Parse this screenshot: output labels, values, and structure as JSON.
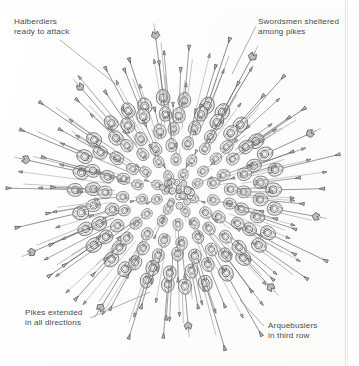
{
  "page": {
    "kind": "scanned-book-illustration",
    "background_color": "#fdfdfc",
    "ink_color": "#5a5a5a",
    "label_color": "#4a4a4a",
    "leader_color": "#8c8c8c",
    "width": 359,
    "height": 366
  },
  "annotations": [
    {
      "id": "halberdiers",
      "text": "Halberdiers\nready to attack",
      "position": "top-left",
      "leader_from": [
        60,
        40
      ],
      "leader_to": [
        118,
        86
      ]
    },
    {
      "id": "swordsmen",
      "text": "Swordsmen sheltered\namong pikes",
      "position": "top-right",
      "leader_from": [
        256,
        26
      ],
      "leader_to": [
        232,
        74
      ]
    },
    {
      "id": "pikes",
      "text": "Pikes extended\nin all directions",
      "position": "bottom-left",
      "leader_from": [
        90,
        318
      ],
      "leader_to": [
        150,
        292
      ]
    },
    {
      "id": "arquebusiers",
      "text": "Arquebusiers\nin third row",
      "position": "bottom-right",
      "leader_from": [
        264,
        326
      ],
      "leader_to": [
        240,
        300
      ]
    }
  ],
  "illustration": {
    "center_x": 176,
    "center_y": 192,
    "formation_radius": 96,
    "pike_tip_radius": 150,
    "rings": [
      {
        "name": "inner-core",
        "radius": 20,
        "count": 8,
        "unit": "pikemen"
      },
      {
        "name": "ring-2",
        "radius": 36,
        "count": 14,
        "unit": "pikemen"
      },
      {
        "name": "ring-3",
        "radius": 52,
        "count": 20,
        "unit": "arquebusiers"
      },
      {
        "name": "ring-4",
        "radius": 68,
        "count": 24,
        "unit": "swordsmen"
      },
      {
        "name": "ring-5",
        "radius": 84,
        "count": 28,
        "unit": "pikemen"
      },
      {
        "name": "outer-ring",
        "radius": 99,
        "count": 30,
        "unit": "halberdiers"
      }
    ]
  }
}
